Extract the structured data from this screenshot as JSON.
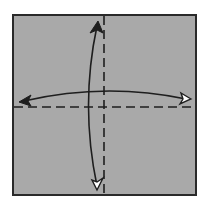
{
  "diagram": {
    "type": "origami-fold-diagram",
    "paper": {
      "x": 13,
      "y": 15,
      "width": 183,
      "height": 180,
      "fill": "#a9a9a9",
      "stroke": "#2a2a2a"
    },
    "crease_lines": [
      {
        "name": "vertical-valley-fold",
        "x1": 104,
        "y1": 16,
        "x2": 104,
        "y2": 194,
        "style": "dashed"
      },
      {
        "name": "horizontal-valley-fold",
        "x1": 14,
        "y1": 107,
        "x2": 195,
        "y2": 107,
        "style": "dashed"
      }
    ],
    "arrows": [
      {
        "name": "vertical-fold-unfold-arrow",
        "start": [
          97,
          188
        ],
        "control": [
          80,
          105
        ],
        "end": [
          98,
          22
        ],
        "start_head": "hollow",
        "end_head": "filled"
      },
      {
        "name": "horizontal-fold-unfold-arrow",
        "start": [
          20,
          102
        ],
        "control": [
          105,
          82
        ],
        "end": [
          190,
          99
        ],
        "start_head": "filled",
        "end_head": "hollow"
      }
    ],
    "colors": {
      "paper": "#a9a9a9",
      "line": "#1e1e1e",
      "hollow_head": "#ffffff",
      "background": "#ffffff"
    }
  }
}
